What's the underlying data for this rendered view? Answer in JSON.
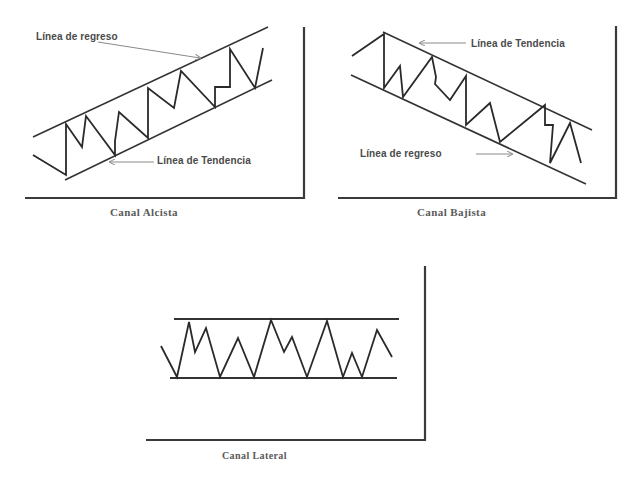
{
  "colors": {
    "line": "#2a2a2a",
    "axis": "#3a3a3a",
    "arrow": "#8a8a8a",
    "label": "#4a4a4a",
    "caption": "#5a5a5a",
    "background": "#ffffff"
  },
  "panels": {
    "alcista": {
      "caption": "Canal Alcista",
      "upper_label": "Línea de regreso",
      "lower_label": "Línea de Tendencia",
      "axis": {
        "x": 304,
        "y_top": 27,
        "y_bottom": 198,
        "x_left": 25
      },
      "upper_line": [
        [
          33,
          137
        ],
        [
          268,
          27
        ]
      ],
      "lower_line": [
        [
          65,
          180
        ],
        [
          272,
          80
        ]
      ],
      "zigzag": [
        [
          33,
          155
        ],
        [
          66,
          175
        ],
        [
          66,
          124
        ],
        [
          82,
          147
        ],
        [
          86,
          116
        ],
        [
          115,
          155
        ],
        [
          115,
          141
        ],
        [
          119,
          112
        ],
        [
          148,
          138
        ],
        [
          148,
          88
        ],
        [
          174,
          108
        ],
        [
          181,
          71
        ],
        [
          215,
          107
        ],
        [
          215,
          87
        ],
        [
          230,
          87
        ],
        [
          230,
          49
        ],
        [
          255,
          88
        ],
        [
          263,
          48
        ]
      ],
      "upper_arrow": [
        [
          98,
          42
        ],
        [
          200,
          58
        ]
      ],
      "lower_arrow": [
        [
          154,
          162
        ],
        [
          110,
          162
        ]
      ]
    },
    "bajista": {
      "caption": "Canal Bajista",
      "upper_label": "Línea de Tendencia",
      "lower_label": "Línea de regreso",
      "axis": {
        "x": 616,
        "y_top": 26,
        "y_bottom": 198,
        "x_left": 338
      },
      "upper_line": [
        [
          383,
          32
        ],
        [
          592,
          130
        ]
      ],
      "lower_line": [
        [
          351,
          75
        ],
        [
          586,
          184
        ]
      ],
      "zigzag": [
        [
          352,
          56
        ],
        [
          384,
          34
        ],
        [
          384,
          88
        ],
        [
          400,
          66
        ],
        [
          403,
          97
        ],
        [
          432,
          57
        ],
        [
          436,
          77
        ],
        [
          435,
          84
        ],
        [
          450,
          100
        ],
        [
          466,
          76
        ],
        [
          466,
          125
        ],
        [
          490,
          103
        ],
        [
          500,
          142
        ],
        [
          545,
          105
        ],
        [
          545,
          125
        ],
        [
          553,
          125
        ],
        [
          550,
          163
        ],
        [
          570,
          123
        ],
        [
          581,
          163
        ]
      ],
      "upper_arrow": [
        [
          466,
          43
        ],
        [
          420,
          43
        ]
      ],
      "lower_arrow": [
        [
          476,
          154
        ],
        [
          512,
          154
        ]
      ]
    },
    "lateral": {
      "caption": "Canal Lateral",
      "axis": {
        "x": 425,
        "y_top": 266,
        "y_bottom": 440,
        "x_left": 146
      },
      "upper_line": [
        [
          174,
          319
        ],
        [
          399,
          319
        ]
      ],
      "lower_line": [
        [
          170,
          378
        ],
        [
          397,
          378
        ]
      ],
      "zigzag": [
        [
          161,
          346
        ],
        [
          177,
          377
        ],
        [
          189,
          322
        ],
        [
          195,
          352
        ],
        [
          206,
          328
        ],
        [
          220,
          377
        ],
        [
          238,
          338
        ],
        [
          254,
          377
        ],
        [
          271,
          320
        ],
        [
          284,
          352
        ],
        [
          292,
          337
        ],
        [
          307,
          377
        ],
        [
          327,
          321
        ],
        [
          343,
          377
        ],
        [
          352,
          353
        ],
        [
          362,
          377
        ],
        [
          377,
          330
        ],
        [
          392,
          357
        ]
      ]
    }
  }
}
